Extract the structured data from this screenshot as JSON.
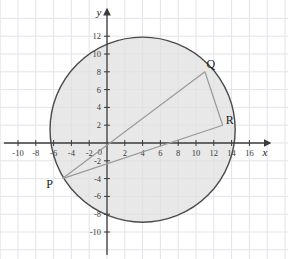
{
  "figure": {
    "background_color": "#ffffff",
    "grid_color": "#e3e3ea",
    "axis_color": "#3b3b3b",
    "circle_stroke": "#4a4a4a",
    "circle_fill": "#e0e0e0",
    "chord_color": "#9a9a9a"
  },
  "axes": {
    "x_name": "x",
    "y_name": "y",
    "x_ticks": [
      {
        "label": "-10",
        "value": -10
      },
      {
        "label": "-8",
        "value": -8
      },
      {
        "label": "-6",
        "value": -6
      },
      {
        "label": "-4",
        "value": -4
      },
      {
        "label": "-2",
        "value": -2
      },
      {
        "label": "2",
        "value": 2
      },
      {
        "label": "4",
        "value": 4
      },
      {
        "label": "6",
        "value": 6
      },
      {
        "label": "8",
        "value": 8
      },
      {
        "label": "10",
        "value": 10
      },
      {
        "label": "12",
        "value": 12
      },
      {
        "label": "14",
        "value": 14
      },
      {
        "label": "16",
        "value": 16
      }
    ],
    "y_ticks": [
      {
        "label": "12",
        "value": 12
      },
      {
        "label": "10",
        "value": 10
      },
      {
        "label": "8",
        "value": 8
      },
      {
        "label": "6",
        "value": 6
      },
      {
        "label": "4",
        "value": 4
      },
      {
        "label": "2",
        "value": 2
      },
      {
        "label": "-2",
        "value": -2
      },
      {
        "label": "-4",
        "value": -4
      },
      {
        "label": "-6",
        "value": -6
      },
      {
        "label": "-8",
        "value": -8
      },
      {
        "label": "-10",
        "value": -10
      }
    ],
    "origin_label": "0",
    "x_range": [
      -11.9,
      19.9
    ],
    "y_range": [
      -11.5,
      13.5
    ]
  },
  "chart_data": {
    "type": "scatter",
    "title": "",
    "xlabel": "x",
    "ylabel": "y",
    "xlim": [
      -11.9,
      19.9
    ],
    "ylim": [
      -11.5,
      13.5
    ],
    "grid": true,
    "circle": {
      "center_x": 4,
      "center_y": 1.5,
      "radius": 10.4
    },
    "points": [
      {
        "name": "P",
        "x": -5,
        "y": -4,
        "label": "P"
      },
      {
        "name": "Q",
        "x": 11,
        "y": 8,
        "label": "Q"
      },
      {
        "name": "R",
        "x": 13,
        "y": 2,
        "label": "R"
      }
    ],
    "chords": [
      {
        "from": "P",
        "to": "Q"
      },
      {
        "from": "P",
        "to": "R"
      },
      {
        "from": "Q",
        "to": "R"
      }
    ]
  }
}
